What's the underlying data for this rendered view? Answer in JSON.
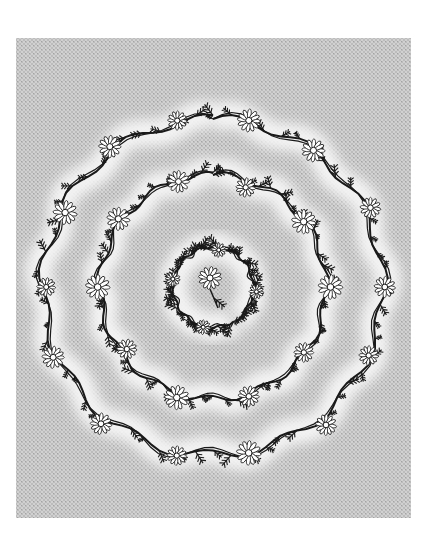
{
  "artwork": {
    "subject": "Concentric floral wreaths of daisies and leafy vines",
    "alt": "Black-and-white engraving-style illustration of three concentric rings of daisy vines on a gray crosshatched background",
    "colors": {
      "page": "#ffffff",
      "panel": "#c9c9c9",
      "panel_dark": "#b4b4b4",
      "halo": "#f4f4f4",
      "ink": "#1a1a1a",
      "petal": "#ffffff"
    },
    "panel": {
      "x": 16,
      "y": 38,
      "width": 395,
      "height": 480
    },
    "center": {
      "x": 213,
      "y": 287
    },
    "rings": [
      {
        "name": "outer",
        "rx": 170,
        "ry": 168,
        "flowers": 14,
        "start": 0,
        "end": 360
      },
      {
        "name": "middle",
        "rx": 113,
        "ry": 112,
        "flowers": 10,
        "start": 0,
        "end": 360
      },
      {
        "name": "inner",
        "rx": 40,
        "ry": 40,
        "flowers": 4,
        "start": 150,
        "end": 500
      }
    ],
    "center_flower": {
      "x": 210,
      "y": 278,
      "r": 11
    }
  }
}
